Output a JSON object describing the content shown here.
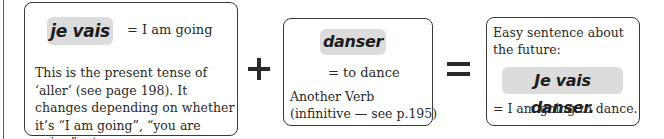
{
  "box1": {
    "french": "je vais",
    "meaning": "= I am going",
    "description": "This is the present tense of ‘aller’ (see page 198).  It changes depending on whether it’s “I am going”, “you are going”, etc."
  },
  "operators": {
    "plus": "+",
    "equals": "="
  },
  "box2": {
    "french": "danser",
    "meaning": "= to dance",
    "label_line1": "Another Verb",
    "label_line2": "(infinitive — see p.195)"
  },
  "box3": {
    "intro_line1": "Easy sentence about",
    "intro_line2": "the future:",
    "french": "Je vais danser.",
    "meaning": "= I am going to dance."
  },
  "colors": {
    "pill_background": "#dcdcdc",
    "border": "#3a3a3a",
    "text": "#2a2a2a"
  }
}
